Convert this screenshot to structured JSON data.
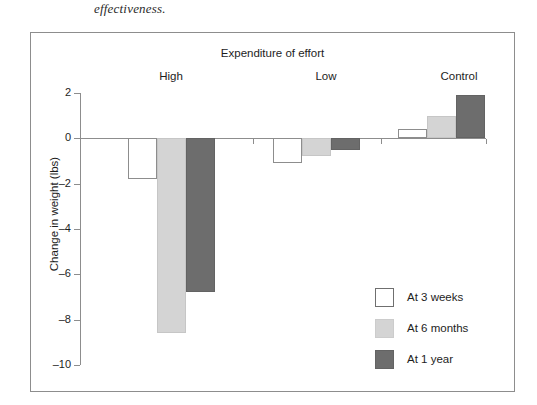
{
  "page": {
    "caption": "effectiveness."
  },
  "chart_data": {
    "type": "bar",
    "title": "Expenditure of effort",
    "xlabel": "",
    "ylabel": "Change in weight (lbs)",
    "categories": [
      "High",
      "Low",
      "Control"
    ],
    "series": [
      {
        "name": "At 3 weeks",
        "values": [
          -1.8,
          -1.1,
          0.4
        ],
        "color": "#ffffff"
      },
      {
        "name": "At 6 months",
        "values": [
          -8.6,
          -0.8,
          1.0
        ],
        "color": "#d4d4d4"
      },
      {
        "name": "At 1 year",
        "values": [
          -6.8,
          -0.5,
          1.9
        ],
        "color": "#6d6d6d"
      }
    ],
    "ylim": [
      -10,
      2
    ],
    "yticks": [
      2,
      0,
      -2,
      -4,
      -6,
      -8,
      -10
    ],
    "ytick_labels": [
      "2",
      "0",
      "–2",
      "–4",
      "–6",
      "–8",
      "–10"
    ],
    "grid": false,
    "legend_position": "inside-lower-right",
    "zero_line": 0
  }
}
